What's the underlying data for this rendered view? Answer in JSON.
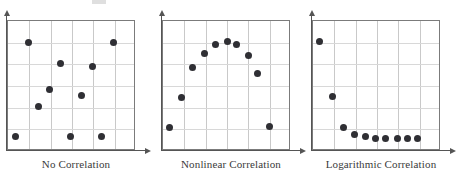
{
  "figure": {
    "background_color": "#ffffff",
    "dot_color": "#2f2f34",
    "grid_color": "#c9c9c9",
    "frame_color": "#7b7b7b",
    "axis_color": "#555555"
  },
  "panels": [
    {
      "caption": "No Correlation",
      "frame": {
        "left": 7,
        "top": 20,
        "width": 128,
        "height": 130
      },
      "grid": {
        "cols": 6,
        "rows": 6
      },
      "axis_arrows": {
        "x": true,
        "y": true
      }
    },
    {
      "caption": "Nonlinear Correlation",
      "frame": {
        "left": 7,
        "top": 20,
        "width": 128,
        "height": 130
      },
      "grid": {
        "cols": 6,
        "rows": 6
      },
      "axis_arrows": {
        "x": true,
        "y": true
      }
    },
    {
      "caption": "Logarithmic Correlation",
      "frame": {
        "left": 7,
        "top": 20,
        "width": 128,
        "height": 130
      },
      "grid": {
        "cols": 6,
        "rows": 6
      },
      "axis_arrows": {
        "x": true,
        "y": true
      }
    }
  ],
  "chart_data": [
    {
      "type": "scatter",
      "title": "No Correlation",
      "xlabel": "",
      "ylabel": "",
      "xlim": [
        0,
        6
      ],
      "ylim": [
        0,
        6
      ],
      "grid": true,
      "legend": "none",
      "points": [
        {
          "x": 0.35,
          "y": 0.65
        },
        {
          "x": 0.95,
          "y": 5.0
        },
        {
          "x": 1.45,
          "y": 2.05
        },
        {
          "x": 1.95,
          "y": 2.85
        },
        {
          "x": 2.95,
          "y": 0.65
        },
        {
          "x": 2.45,
          "y": 4.05
        },
        {
          "x": 3.45,
          "y": 2.55
        },
        {
          "x": 3.95,
          "y": 3.9
        },
        {
          "x": 4.4,
          "y": 0.65
        },
        {
          "x": 4.95,
          "y": 5.0
        }
      ]
    },
    {
      "type": "scatter",
      "title": "Nonlinear Correlation",
      "xlabel": "",
      "ylabel": "",
      "xlim": [
        0,
        6
      ],
      "ylim": [
        0,
        6
      ],
      "grid": true,
      "legend": "none",
      "points": [
        {
          "x": 0.3,
          "y": 1.1
        },
        {
          "x": 0.85,
          "y": 2.45
        },
        {
          "x": 1.4,
          "y": 3.85
        },
        {
          "x": 1.95,
          "y": 4.5
        },
        {
          "x": 2.45,
          "y": 4.9
        },
        {
          "x": 3.0,
          "y": 5.05
        },
        {
          "x": 3.45,
          "y": 4.9
        },
        {
          "x": 4.0,
          "y": 4.4
        },
        {
          "x": 4.45,
          "y": 3.6
        },
        {
          "x": 5.0,
          "y": 1.15
        }
      ]
    },
    {
      "type": "scatter",
      "title": "Logarithmic Correlation",
      "xlabel": "",
      "ylabel": "",
      "xlim": [
        0,
        6
      ],
      "ylim": [
        0,
        6
      ],
      "grid": true,
      "legend": "none",
      "points": [
        {
          "x": 0.3,
          "y": 5.05
        },
        {
          "x": 0.9,
          "y": 2.5
        },
        {
          "x": 1.45,
          "y": 1.1
        },
        {
          "x": 1.95,
          "y": 0.75
        },
        {
          "x": 2.45,
          "y": 0.65
        },
        {
          "x": 2.95,
          "y": 0.6
        },
        {
          "x": 3.4,
          "y": 0.6
        },
        {
          "x": 3.95,
          "y": 0.6
        },
        {
          "x": 4.45,
          "y": 0.6
        },
        {
          "x": 4.9,
          "y": 0.6
        }
      ]
    }
  ]
}
